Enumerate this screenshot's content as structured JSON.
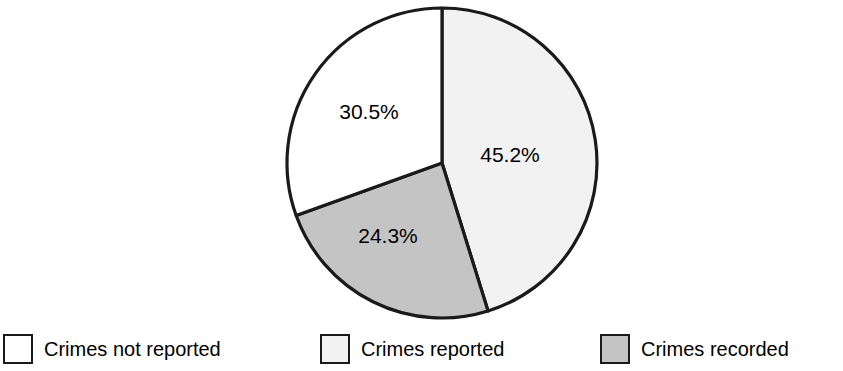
{
  "chart_data": {
    "type": "pie",
    "title": "",
    "subtitle": "",
    "xlabel": "",
    "ylabel": "",
    "legend_position": "bottom",
    "grid": false,
    "categories": [
      "Crimes not reported",
      "Crimes reported",
      "Crimes recorded"
    ],
    "values": [
      30.5,
      45.2,
      24.3
    ],
    "units": "%",
    "slices": [
      {
        "label": "Crimes reported",
        "value": 45.2,
        "data_label": "45.2%",
        "color": "#f2f2f2",
        "start_angle_deg": 0,
        "end_angle_deg": 162.72
      },
      {
        "label": "Crimes recorded",
        "value": 24.3,
        "data_label": "24.3%",
        "color": "#c4c4c4",
        "start_angle_deg": 162.72,
        "end_angle_deg": 250.2
      },
      {
        "label": "Crimes not reported",
        "value": 30.5,
        "data_label": "30.5%",
        "color": "#ffffff",
        "start_angle_deg": 250.2,
        "end_angle_deg": 360
      }
    ],
    "outline_color": "#1a1a1a"
  },
  "pie": {
    "labels": {
      "reported": "45.2%",
      "recorded": "24.3%",
      "not_reported": "30.5%"
    }
  },
  "legend": {
    "items": [
      {
        "label": "Crimes not reported",
        "color": "#ffffff",
        "swatch_name": "legend-swatch-crimes-not-reported"
      },
      {
        "label": "Crimes reported",
        "color": "#f2f2f2",
        "swatch_name": "legend-swatch-crimes-reported"
      },
      {
        "label": "Crimes recorded",
        "color": "#c4c4c4",
        "swatch_name": "legend-swatch-crimes-recorded"
      }
    ]
  }
}
